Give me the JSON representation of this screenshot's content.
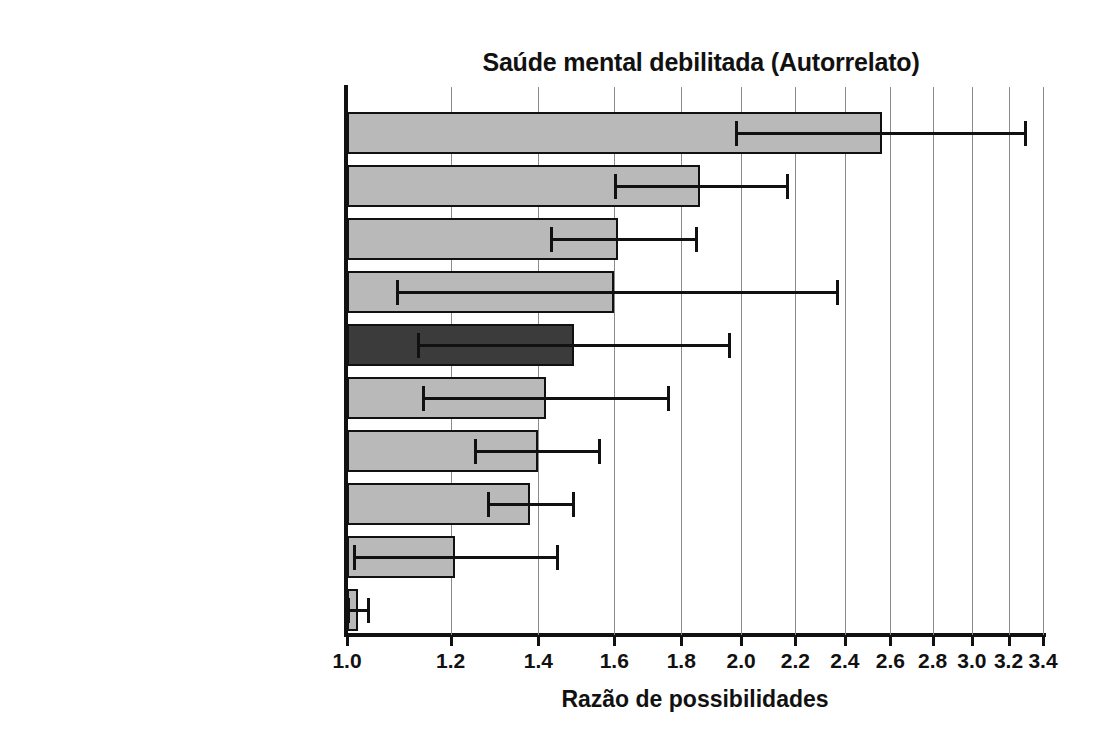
{
  "chart_data": {
    "type": "bar",
    "orientation": "horizontal",
    "title": "Saúde mental debilitada (Autorrelato)",
    "xlabel": "Razão de possibilidades",
    "ylabel": "",
    "xscale": "log",
    "xlim": [
      1.0,
      3.4
    ],
    "grid": true,
    "legend": null,
    "xticks": [
      1.0,
      1.2,
      1.4,
      1.6,
      1.8,
      2.0,
      2.2,
      2.4,
      2.6,
      2.8,
      3.0,
      3.2,
      3.4
    ],
    "xticklabels": [
      "1.0",
      "1.2",
      "1.4",
      "1.6",
      "1.8",
      "2.0",
      "2.2",
      "2.4",
      "2.6",
      "2.8",
      "3.0",
      "3.2",
      "3.4"
    ],
    "categories": [
      "Conflito trabalho-família",
      "Desemprego",
      "Altas demandas de serviço",
      "Pouca equidade organizacional",
      "Exposição passiva ao tabaco",
      "Insegurança no emprego",
      "Pouco controle sobre o trabalho",
      "Pouco apoio social no trabalho",
      "Exposição a trabalho por turnos",
      "Longas jornadas/horas extras"
    ],
    "values": [
      2.56,
      1.86,
      1.61,
      1.6,
      1.49,
      1.42,
      1.4,
      1.38,
      1.21,
      1.02
    ],
    "ci_low": [
      1.98,
      1.6,
      1.43,
      1.09,
      1.13,
      1.14,
      1.25,
      1.28,
      1.01,
      1.0
    ],
    "ci_high": [
      3.3,
      2.17,
      1.85,
      2.37,
      1.96,
      1.76,
      1.56,
      1.49,
      1.45,
      1.04
    ],
    "highlight_index": 4,
    "colors": {
      "bar": "#b9b9b9",
      "bar_highlight": "#3b3b3b",
      "bar_edge": "#111111",
      "grid": "#8b8b8b",
      "axis": "#111111",
      "text": "#1a1a1a",
      "background": "#ffffff"
    }
  }
}
